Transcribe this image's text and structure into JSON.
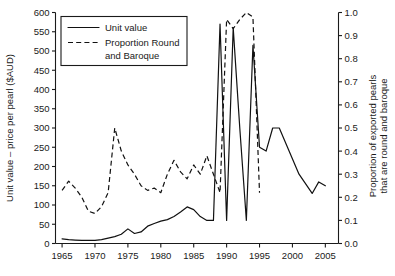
{
  "chart_data": {
    "type": "line",
    "title": "",
    "xlabel": "",
    "ylabel": "Unit value – price per pearl ($AUD)",
    "y2label": "Proportion of exported pearls that are round and baroque",
    "xlim": [
      1964,
      2007
    ],
    "ylim": [
      0,
      600
    ],
    "y2lim": [
      0.0,
      1.0
    ],
    "grid": false,
    "legend_position": "top-left",
    "x_ticks": [
      1965,
      1970,
      1975,
      1980,
      1985,
      1990,
      1995,
      2000,
      2005
    ],
    "x_tick_labels": [
      "1965",
      "1970",
      "1975",
      "1980",
      "1985",
      "1990",
      "1995",
      "2000",
      "2005"
    ],
    "y_ticks": [
      0,
      50,
      100,
      150,
      200,
      250,
      300,
      350,
      400,
      450,
      500,
      550,
      600
    ],
    "y_tick_labels": [
      "0",
      "50",
      "100",
      "150",
      "200",
      "250",
      "300",
      "350",
      "400",
      "450",
      "500",
      "550",
      "600"
    ],
    "y2_ticks": [
      0.0,
      0.1,
      0.2,
      0.3,
      0.4,
      0.5,
      0.6,
      0.7,
      0.8,
      0.9,
      1.0
    ],
    "y2_tick_labels": [
      "0.0",
      "0.1",
      "0.2",
      "0.3",
      "0.4",
      "0.5",
      "0.6",
      "0.7",
      "0.8",
      "0.9",
      "1.0"
    ],
    "series": [
      {
        "name": "Unit value",
        "style": "solid",
        "axis": "left",
        "units": "$AUD per pearl",
        "x": [
          1965,
          1966,
          1967,
          1968,
          1969,
          1970,
          1971,
          1972,
          1973,
          1974,
          1975,
          1976,
          1977,
          1978,
          1979,
          1980,
          1981,
          1982,
          1983,
          1984,
          1985,
          1986,
          1987,
          1988,
          1989,
          1990,
          1991,
          1992,
          1993,
          1994,
          1995,
          1996,
          1997,
          1998,
          1999,
          2000,
          2001,
          2002,
          2003,
          2004,
          2005,
          2006
        ],
        "values": [
          12,
          10,
          9,
          8,
          8,
          8,
          10,
          14,
          18,
          24,
          38,
          26,
          30,
          45,
          52,
          58,
          62,
          70,
          82,
          95,
          88,
          70,
          60,
          60,
          62,
          60,
          60,
          62,
          58,
          55,
          52,
          55,
          58,
          58,
          58,
          58,
          58,
          58,
          58,
          58,
          58,
          58
        ]
      },
      {
        "name": "Proportion Round and Baroque",
        "style": "dashed",
        "axis": "right",
        "units": "proportion",
        "x": [
          1965,
          1966,
          1967,
          1968,
          1969,
          1970,
          1971,
          1972,
          1973,
          1974,
          1975,
          1976,
          1977,
          1978,
          1979,
          1980,
          1981,
          1982,
          1983,
          1984,
          1985,
          1986,
          1987,
          1988,
          1989,
          1990,
          1991,
          1992,
          1993,
          1994,
          1995
        ],
        "values": [
          0.23,
          0.27,
          0.24,
          0.2,
          0.14,
          0.13,
          0.16,
          0.22,
          0.5,
          0.4,
          0.34,
          0.3,
          0.25,
          0.23,
          0.24,
          0.22,
          0.3,
          0.36,
          0.31,
          0.28,
          0.34,
          0.3,
          0.38,
          0.3,
          0.22,
          0.97,
          0.93,
          0.97,
          1.0,
          0.98,
          0.22
        ]
      }
    ],
    "unit_value_detail": {
      "description": "Solid line: low flat values through 1960s-70s rising slowly, peak near 95 in 1984, dip, then large spikes 1989-1995",
      "spikes": [
        {
          "year": 1989,
          "value": 570
        },
        {
          "year": 1990,
          "value": 60
        },
        {
          "year": 1991,
          "value": 560
        },
        {
          "year": 1992,
          "value": 300
        },
        {
          "year": 1993,
          "value": 60
        },
        {
          "year": 1994,
          "value": 515
        },
        {
          "year": 1995,
          "value": 250
        },
        {
          "year": 1996,
          "value": 240
        },
        {
          "year": 1997,
          "value": 300
        },
        {
          "year": 1998,
          "value": 300
        },
        {
          "year": 2001,
          "value": 180
        },
        {
          "year": 2003,
          "value": 130
        },
        {
          "year": 2004,
          "value": 160
        },
        {
          "year": 2005,
          "value": 150
        }
      ]
    }
  },
  "legend": {
    "entries": [
      {
        "label": "Unit value",
        "style": "solid"
      },
      {
        "label": "Proportion Round",
        "style": "dashed"
      },
      {
        "label": "and Baroque",
        "style": "none"
      }
    ]
  }
}
